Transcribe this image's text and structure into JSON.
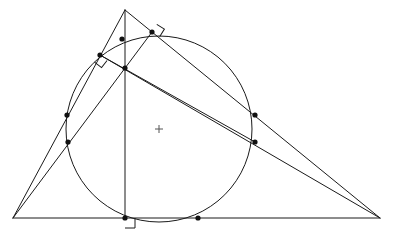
{
  "figure": {
    "background_color": "#ffffff",
    "stroke_color": "#1a1a1a",
    "dot_color": "#111111",
    "center_mark_color": "#555555",
    "canvas": {
      "width": 395,
      "height": 236
    }
  },
  "circle": {
    "name": "main-circle",
    "cx": 159,
    "cy": 129,
    "r": 93
  },
  "center_mark": {
    "name": "circle-center-cross",
    "x": 159,
    "y": 129,
    "arm": 4
  },
  "vertices": {
    "apex": {
      "label": "A",
      "x": 125,
      "y": 10
    },
    "left": {
      "label": "B",
      "x": 13,
      "y": 218
    },
    "right": {
      "label": "C",
      "x": 380,
      "y": 218
    },
    "foot": {
      "label": "H",
      "x": 125,
      "y": 218
    }
  },
  "segments": [
    {
      "name": "side-apex-to-left",
      "x1": 125,
      "y1": 10,
      "x2": 13,
      "y2": 218
    },
    {
      "name": "side-apex-to-right",
      "x1": 125,
      "y1": 10,
      "x2": 380,
      "y2": 218
    },
    {
      "name": "base-left-to-right",
      "x1": 13,
      "y1": 218,
      "x2": 380,
      "y2": 218
    },
    {
      "name": "altitude-apex-to-base",
      "x1": 125,
      "y1": 10,
      "x2": 125,
      "y2": 218
    },
    {
      "name": "cevian-left-to-upper-right",
      "x1": 13,
      "y1": 218,
      "x2": 152,
      "y2": 32
    },
    {
      "name": "cevian-right-to-upper-left",
      "x1": 380,
      "y1": 218,
      "x2": 100,
      "y2": 55
    },
    {
      "name": "chord-upper-left-to-lower-right",
      "x1": 100,
      "y1": 55,
      "x2": 255,
      "y2": 142
    }
  ],
  "points": [
    {
      "name": "point-on-altitude-upper",
      "x": 122,
      "y": 39
    },
    {
      "name": "point-tangency-upper-right",
      "x": 152,
      "y": 32
    },
    {
      "name": "point-tangency-upper-left",
      "x": 100,
      "y": 55
    },
    {
      "name": "point-orthocenter",
      "x": 125,
      "y": 68
    },
    {
      "name": "point-left-upper",
      "x": 67,
      "y": 115
    },
    {
      "name": "point-left-lower",
      "x": 68,
      "y": 142
    },
    {
      "name": "point-right-upper",
      "x": 255,
      "y": 115
    },
    {
      "name": "point-right-lower",
      "x": 255,
      "y": 142
    },
    {
      "name": "point-foot-of-altitude",
      "x": 125,
      "y": 218
    },
    {
      "name": "point-on-base-right",
      "x": 198,
      "y": 218
    }
  ],
  "right_angle_marks": [
    {
      "name": "right-angle-mark-upper-left",
      "x": 100,
      "y": 55,
      "size": 9,
      "rotation": 38
    },
    {
      "name": "right-angle-mark-upper-right",
      "x": 152,
      "y": 32,
      "size": 9,
      "rotation": -58
    },
    {
      "name": "right-angle-mark-base",
      "x": 125,
      "y": 218,
      "size": 10,
      "rotation": 0
    }
  ]
}
